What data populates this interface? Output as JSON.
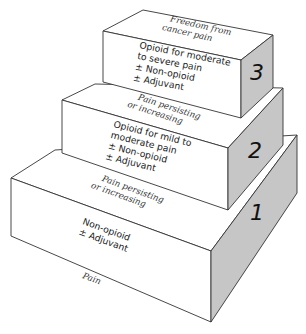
{
  "diagram": {
    "type": "three-step-ladder",
    "face_colors": {
      "front": "#ffffff",
      "top": "#ffffff",
      "side": "#c6c6c6",
      "stroke": "#333333"
    },
    "bottom_label": "Pain",
    "steps": [
      {
        "number": "1",
        "treatment": [
          "Non-opioid",
          "± Adjuvant"
        ],
        "top_label": [
          "Pain persisting",
          "or increasing"
        ]
      },
      {
        "number": "2",
        "treatment": [
          "Opioid for mild to",
          "moderate pain",
          "± Non-opioid",
          "± Adjuvant"
        ],
        "top_label": [
          "Pain persisting",
          "or increasing"
        ]
      },
      {
        "number": "3",
        "treatment": [
          "Opioid for moderate",
          "to severe pain",
          "± Non-opioid",
          "± Adjuvant"
        ],
        "top_label": [
          "Freedom from",
          "cancer pain"
        ]
      }
    ]
  }
}
